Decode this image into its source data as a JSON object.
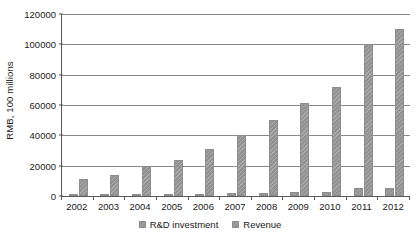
{
  "chart_data": {
    "type": "bar",
    "title": "",
    "subtitle": "",
    "xlabel": "",
    "ylabel": "RMB, 100 millions",
    "categories": [
      "2002",
      "2003",
      "2004",
      "2005",
      "2006",
      "2007",
      "2008",
      "2009",
      "2010",
      "2011",
      "2012"
    ],
    "series": [
      {
        "name": "R&D investment",
        "values": [
          600,
          700,
          800,
          1200,
          1600,
          1800,
          2000,
          2400,
          2700,
          5000,
          5500
        ]
      },
      {
        "name": "Revenue",
        "values": [
          11000,
          14000,
          20000,
          24000,
          31000,
          40000,
          50000,
          61000,
          72000,
          100000,
          110000
        ]
      }
    ],
    "ylim": [
      0,
      120000
    ],
    "ytick_values": [
      0,
      20000,
      40000,
      60000,
      80000,
      100000,
      120000
    ],
    "ytick_labels": [
      "0",
      "20000",
      "40000",
      "60000",
      "80000",
      "100000",
      "120000"
    ],
    "grid": true,
    "grid_axis": "y",
    "legend_position": "bottom",
    "bar_color": "#9a9a9a",
    "axis_color": "#5a5a5a",
    "grid_color": "#8a8a8a"
  },
  "legend": {
    "items": [
      {
        "label": "R&D investment"
      },
      {
        "label": "Revenue"
      }
    ]
  }
}
